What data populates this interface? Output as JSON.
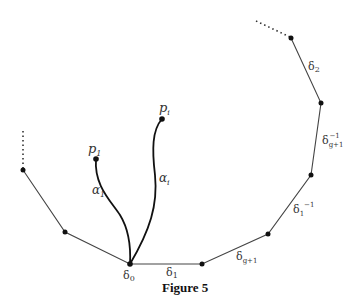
{
  "figure": {
    "caption": "Figure 5",
    "points": {
      "p1": "p",
      "p1_sub": "1",
      "pi": "p",
      "pi_sub": "i"
    },
    "arcs": {
      "alpha1": "α",
      "alpha1_sub": "1",
      "alphai": "α",
      "alphai_sub": "i"
    },
    "edges": {
      "delta0": "δ",
      "delta0_sub": "0",
      "delta1": "δ",
      "delta1_sub": "1",
      "deltag1": "δ",
      "deltag1_sub": "g+1",
      "delta1inv": "δ",
      "delta1inv_sub": "1",
      "delta1inv_sup": "−1",
      "deltag1inv": "δ",
      "deltag1inv_sub": "g+1",
      "deltag1inv_sup": "−1",
      "delta2": "δ",
      "delta2_sub": "2"
    },
    "colors": {
      "line": "#444444",
      "curve": "#111111"
    }
  }
}
